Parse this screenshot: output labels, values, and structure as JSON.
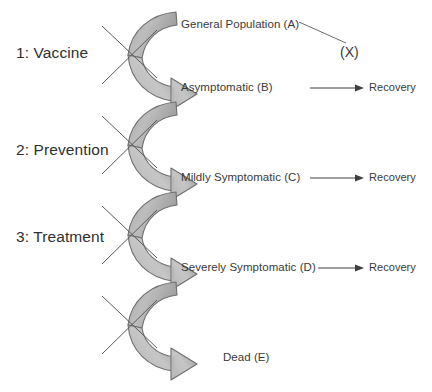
{
  "diagram": {
    "background_color": "#ffffff",
    "arrow_fill_light": "#c9c9c9",
    "arrow_fill_dark": "#8f8f8f",
    "arrow_stroke": "#6e6e6e",
    "line_color": "#4a4a4a",
    "text_color": "#3a3a3a"
  },
  "interventions": [
    {
      "id": "vaccine",
      "label": "1: Vaccine"
    },
    {
      "id": "prevention",
      "label": "2: Prevention"
    },
    {
      "id": "treatment",
      "label": "3: Treatment"
    }
  ],
  "states": [
    {
      "id": "A",
      "label": "General Population (A)"
    },
    {
      "id": "B",
      "label": "Asymptomatic (B)"
    },
    {
      "id": "C",
      "label": "Mildly Symptomatic (C)"
    },
    {
      "id": "D",
      "label": "Severely Symptomatic (D)"
    },
    {
      "id": "E",
      "label": "Dead (E)"
    }
  ],
  "outcomes": {
    "recovery_label": "Recovery",
    "recovery_from": [
      "B",
      "C",
      "D"
    ],
    "exit_label": "(X)"
  },
  "blocked_transitions": [
    {
      "from": "A",
      "to": "B",
      "blocked_by": "vaccine"
    },
    {
      "from": "B",
      "to": "C",
      "blocked_by": "prevention"
    },
    {
      "from": "C",
      "to": "D",
      "blocked_by": "treatment"
    },
    {
      "from": "D",
      "to": "E",
      "blocked_by": ""
    }
  ],
  "icons": {
    "curved_arrow": "curved-arrow-icon",
    "block_cross": "block-cross-icon",
    "straight_arrow": "straight-arrow-icon",
    "exit_connector": "exit-connector-line"
  }
}
